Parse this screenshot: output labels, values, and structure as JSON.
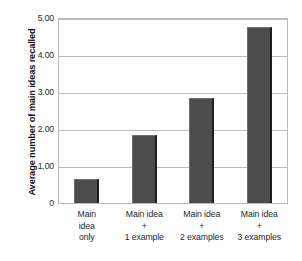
{
  "chart_data": {
    "type": "bar",
    "title": "",
    "xlabel": "",
    "ylabel": "Average number of main ideas recalled",
    "categories": [
      "Main idea only",
      "Main idea + 1 example",
      "Main idea + 2 examples",
      "Main idea + 3 examples"
    ],
    "category_lines": [
      [
        "Main",
        "idea",
        "only"
      ],
      [
        "Main idea",
        "+",
        "1 example"
      ],
      [
        "Main idea",
        "+",
        "2 examples"
      ],
      [
        "Main idea",
        "+",
        "3 examples"
      ]
    ],
    "values": [
      0.65,
      1.85,
      2.85,
      4.75
    ],
    "ylim": [
      0,
      5
    ],
    "yticks": [
      0,
      1,
      2,
      3,
      4,
      5
    ],
    "ytick_labels": [
      "0",
      "1.00",
      "2.00",
      "3.00",
      "4.00",
      "5.00"
    ],
    "grid": true,
    "legend": "none",
    "bar_color": "#4c4c4c",
    "gridline_color": "#bcbcbc",
    "background_color": "#ffffff"
  }
}
